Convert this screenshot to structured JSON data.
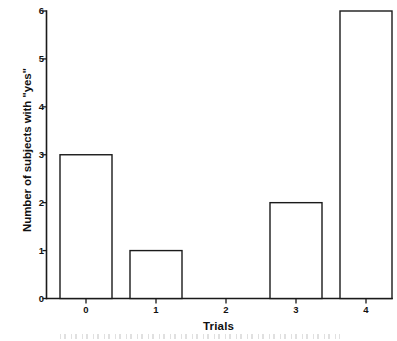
{
  "chart_data": {
    "type": "bar",
    "title": "",
    "xlabel": "Trials",
    "ylabel": "Number of subjects with \"yes\"",
    "categories": [
      "0",
      "1",
      "2",
      "3",
      "4"
    ],
    "values": [
      3,
      1,
      0,
      2,
      6
    ],
    "series": [
      {
        "name": "Number of subjects with \"yes\"",
        "values": [
          3,
          1,
          0,
          2,
          6
        ]
      }
    ],
    "xtick_labels": [
      "0",
      "1",
      "2",
      "3",
      "4"
    ],
    "ytick_labels": [
      "0",
      "1",
      "2",
      "3",
      "4",
      "5",
      "6"
    ],
    "yticks": [
      0,
      1,
      2,
      3,
      4,
      5,
      6
    ],
    "ylim": [
      0,
      6
    ],
    "grid": false,
    "legend": false,
    "legend_position": "none",
    "bar_style": "hollow-outline",
    "colors": {
      "bar_fill": "#ffffff",
      "bar_stroke": "#1a1a1a",
      "axis": "#1a1a1a",
      "text": "#111111",
      "background": "#ffffff"
    }
  }
}
